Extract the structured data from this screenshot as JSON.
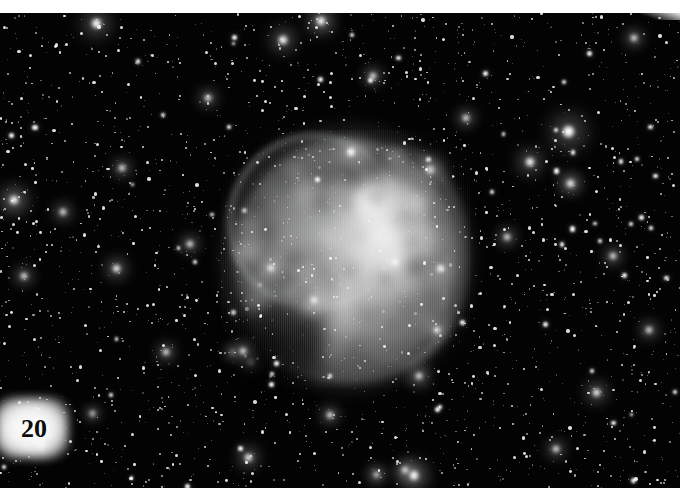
{
  "plate": {
    "label": "20",
    "width": 680,
    "height": 488,
    "top_margin_color": "#ffffff",
    "sky_color": "#030303",
    "nebula_color": "#c8c9ca",
    "label_text_color": "#0c0c0c"
  },
  "image": {
    "type": "astronomical-photograph",
    "subject": "planetary nebula in dense star field",
    "palette": "grayscale",
    "nebula": {
      "center_x": 345,
      "center_y": 256,
      "width": 224,
      "height": 238,
      "bright_core_x": 378,
      "bright_core_y": 232
    }
  },
  "annotations": {
    "figure_number": "20"
  }
}
